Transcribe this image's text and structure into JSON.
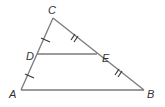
{
  "diagram": {
    "type": "triangle-midsegment",
    "points": {
      "A": {
        "label": "A",
        "x": 21,
        "y": 90,
        "lx": 9,
        "ly": 98
      },
      "B": {
        "label": "B",
        "x": 144,
        "y": 90,
        "lx": 147,
        "ly": 98
      },
      "C": {
        "label": "C",
        "x": 53,
        "y": 18,
        "lx": 48,
        "ly": 14
      },
      "D": {
        "label": "D",
        "x": 37,
        "y": 54,
        "lx": 26,
        "ly": 60
      },
      "E": {
        "label": "E",
        "x": 97,
        "y": 54,
        "lx": 102,
        "ly": 62
      }
    },
    "segments": [
      "AC",
      "CB",
      "AB",
      "DE"
    ],
    "congruence_marks": [
      {
        "segment": "CD",
        "ticks": 1
      },
      {
        "segment": "DA",
        "ticks": 1
      },
      {
        "segment": "CE",
        "ticks": 2
      },
      {
        "segment": "EB",
        "ticks": 2
      }
    ],
    "colors": {
      "line": "#7a7a7a",
      "tick": "#3a3a3a",
      "label": "#333333",
      "background": "#ffffff"
    }
  }
}
